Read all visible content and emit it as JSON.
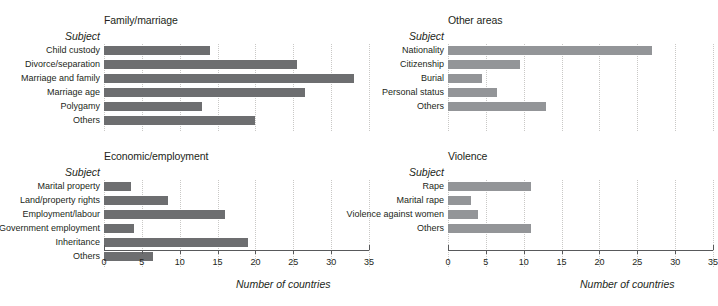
{
  "axis_title": "Number of countries",
  "subject_header": "Subject",
  "chart_data": [
    {
      "id": "family",
      "type": "bar",
      "orientation": "horizontal",
      "title": "Family/marriage",
      "xlabel": "Number of countries",
      "ylabel": "Subject",
      "xlim": [
        0,
        35
      ],
      "xticks": [
        "0",
        "5",
        "10",
        "15",
        "20",
        "25",
        "30",
        "35"
      ],
      "grid": true,
      "bar_color": "#6d6e70",
      "categories": [
        "Child custody",
        "Divorce/separation",
        "Marriage and family",
        "Marriage age",
        "Polygamy",
        "Others"
      ],
      "values": [
        14,
        25.5,
        33,
        26.5,
        13,
        20
      ]
    },
    {
      "id": "economic",
      "type": "bar",
      "orientation": "horizontal",
      "title": "Economic/employment",
      "xlabel": "Number of countries",
      "ylabel": "Subject",
      "xlim": [
        0,
        35
      ],
      "xticks": [
        "0",
        "5",
        "10",
        "15",
        "20",
        "25",
        "30",
        "35"
      ],
      "grid": true,
      "bar_color": "#6d6e70",
      "categories": [
        "Marital property",
        "Land/property rights",
        "Employment/labour",
        "Government employment",
        "Inheritance",
        "Others"
      ],
      "values": [
        3.5,
        8.5,
        16,
        4,
        19,
        6.5
      ]
    },
    {
      "id": "other-areas",
      "type": "bar",
      "orientation": "horizontal",
      "title": "Other areas",
      "xlabel": "Number of countries",
      "ylabel": "Subject",
      "xlim": [
        0,
        35
      ],
      "xticks": [
        "0",
        "5",
        "10",
        "15",
        "20",
        "25",
        "30",
        "35"
      ],
      "grid": true,
      "bar_color": "#939598",
      "categories": [
        "Nationality",
        "Citizenship",
        "Burial",
        "Personal status",
        "Others"
      ],
      "values": [
        27,
        9.5,
        4.5,
        6.5,
        13
      ]
    },
    {
      "id": "violence",
      "type": "bar",
      "orientation": "horizontal",
      "title": "Violence",
      "xlabel": "Number of countries",
      "ylabel": "Subject",
      "xlim": [
        0,
        35
      ],
      "xticks": [
        "0",
        "5",
        "10",
        "15",
        "20",
        "25",
        "30",
        "35"
      ],
      "grid": true,
      "bar_color": "#939598",
      "categories": [
        "Rape",
        "Marital rape",
        "Violence against women",
        "Others"
      ],
      "values": [
        11,
        3,
        4,
        11
      ]
    }
  ]
}
